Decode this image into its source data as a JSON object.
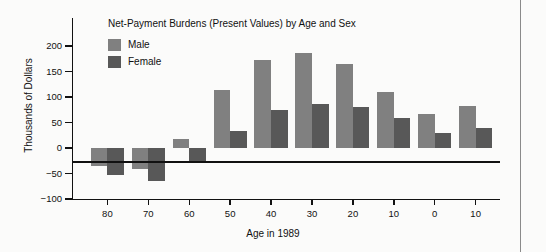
{
  "chart_data": {
    "type": "bar",
    "title": "Net-Payment Burdens (Present Values) by Age and Sex",
    "xlabel": "Age in 1989",
    "ylabel": "Thousands of Dollars",
    "categories": [
      "80",
      "70",
      "60",
      "50",
      "40",
      "30",
      "20",
      "10",
      "0",
      "10"
    ],
    "series": [
      {
        "name": "Male",
        "color": "#808080",
        "values": [
          -35,
          -42,
          18,
          113,
          172,
          187,
          165,
          110,
          66,
          83
        ]
      },
      {
        "name": "Female",
        "color": "#585858",
        "values": [
          -53,
          -65,
          -30,
          34,
          75,
          86,
          81,
          58,
          30,
          40
        ]
      }
    ],
    "ylim": [
      -100,
      200
    ],
    "yticks": [
      200,
      150,
      100,
      50,
      0,
      -50,
      -100
    ],
    "ytick_labels": [
      "200",
      "150",
      "100",
      "50",
      "0",
      "−50",
      "−100"
    ],
    "grid": false,
    "legend_position": "top-left",
    "zero_line": true
  },
  "legend": {
    "entries": [
      {
        "label": "Male"
      },
      {
        "label": "Female"
      }
    ]
  }
}
